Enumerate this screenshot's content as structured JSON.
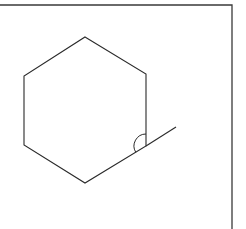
{
  "diagram": {
    "title": "",
    "colors": {
      "background": "#ffffff",
      "stroke": "#2a2a2a",
      "frame": "#3a3a3a"
    },
    "frame": {
      "top_y": 5,
      "right_x": 232,
      "left_x": 0,
      "bottom_y": 229
    },
    "hexagon": {
      "vertices": [
        {
          "name": "top",
          "x": 85,
          "y": 37
        },
        {
          "name": "upper-right",
          "x": 146,
          "y": 74
        },
        {
          "name": "lower-right",
          "x": 146,
          "y": 146
        },
        {
          "name": "bottom",
          "x": 85,
          "y": 183
        },
        {
          "name": "lower-left",
          "x": 24,
          "y": 145
        },
        {
          "name": "upper-left",
          "x": 24,
          "y": 76
        }
      ]
    },
    "extension_line": {
      "from": {
        "x": 146,
        "y": 146
      },
      "to": {
        "x": 176,
        "y": 127
      }
    },
    "angle_marker": {
      "vertex": {
        "x": 146,
        "y": 146
      },
      "radius": 12,
      "label": "exterior angle"
    }
  }
}
